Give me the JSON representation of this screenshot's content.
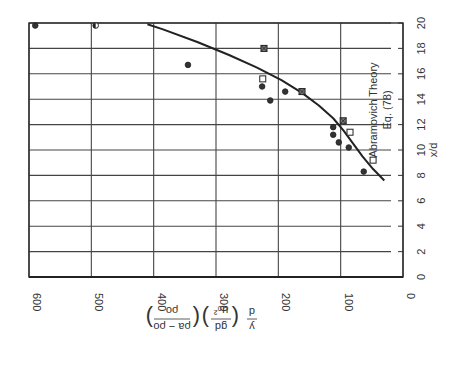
{
  "chart_data": {
    "type": "scatter",
    "orientation_note": "figure printed rotated 90 degrees clockwise",
    "title": "",
    "xlabel": "x/d",
    "ylabel": "(y/d)(g d/u0^2)((rho_a - rho_0)/rho_0)",
    "x_ticks": [
      0,
      2,
      4,
      6,
      8,
      10,
      12,
      14,
      16,
      18,
      20
    ],
    "y_ticks": [
      0,
      100,
      200,
      300,
      400,
      500,
      600
    ],
    "xlim": [
      0,
      20
    ],
    "ylim": [
      0,
      600
    ],
    "grid": true,
    "annotations": [
      {
        "text": "Abramovich Theory",
        "line2": "Eq. (78)"
      }
    ],
    "series": [
      {
        "name": "Abramovich Theory Eq. (78)",
        "type": "line",
        "points": [
          [
            7.6,
            30
          ],
          [
            8.5,
            48
          ],
          [
            9.5,
            65
          ],
          [
            10.5,
            80
          ],
          [
            11.5,
            95
          ],
          [
            12.5,
            112
          ],
          [
            13.5,
            135
          ],
          [
            14.5,
            162
          ],
          [
            15.5,
            195
          ],
          [
            16.5,
            235
          ],
          [
            17.5,
            280
          ],
          [
            18.5,
            330
          ],
          [
            19.5,
            385
          ],
          [
            19.9,
            410
          ]
        ]
      },
      {
        "name": "Data (filled circles)",
        "marker": "filled-circle",
        "points": [
          [
            19.8,
            590
          ],
          [
            16.7,
            345
          ],
          [
            15.0,
            226
          ],
          [
            13.9,
            213
          ],
          [
            14.6,
            189
          ],
          [
            11.8,
            112
          ],
          [
            11.2,
            112
          ],
          [
            10.6,
            103
          ],
          [
            10.2,
            87
          ],
          [
            8.3,
            63
          ]
        ]
      },
      {
        "name": "Data (half-filled circles)",
        "marker": "half-circle",
        "points": [
          [
            19.8,
            493
          ]
        ]
      },
      {
        "name": "Data (open squares)",
        "marker": "open-square",
        "points": [
          [
            15.6,
            225
          ],
          [
            11.4,
            85
          ],
          [
            9.2,
            48
          ]
        ]
      },
      {
        "name": "Data (crossed squares)",
        "marker": "crossed-square",
        "points": [
          [
            18.0,
            223
          ],
          [
            14.6,
            162
          ],
          [
            12.3,
            96
          ]
        ]
      }
    ]
  },
  "labels": {
    "xaxis_label": "x/d",
    "annotation_line1": "Abramovich Theory",
    "annotation_line2": "Eq. (78)",
    "ylabel_part1": "y",
    "ylabel_part1_den": "d",
    "ylabel_part2_num": "gd",
    "ylabel_part2_den": "u₀²",
    "ylabel_part3_num": "ρa − ρo",
    "ylabel_part3_den": "ρo"
  }
}
